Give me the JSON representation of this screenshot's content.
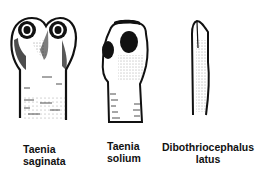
{
  "figure": {
    "specimens": [
      {
        "id": "taenia-saginata",
        "label_line1": "Taenia",
        "label_line2": "saginata"
      },
      {
        "id": "taenia-solium",
        "label_line1": "Taenia",
        "label_line2": "solium"
      },
      {
        "id": "dibothriocephalus-latus",
        "label_line1": "Dibothriocephalus",
        "label_line2": "latus"
      }
    ],
    "colors": {
      "ink": "#111111",
      "background": "#ffffff"
    }
  }
}
